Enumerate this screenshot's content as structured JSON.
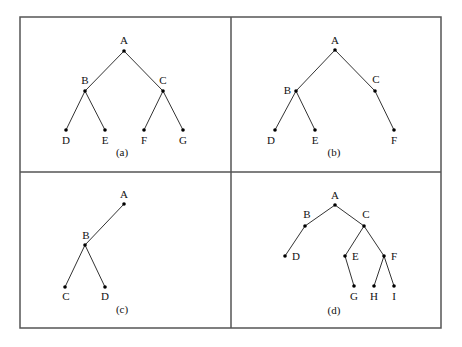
{
  "figure": {
    "frame": {
      "x1": 20,
      "y1": 17,
      "x2": 441,
      "y2": 328,
      "divider_x": 231,
      "divider_y": 172,
      "stroke": "#555555"
    },
    "panels": [
      {
        "id": "a",
        "caption": "(a)",
        "caption_pos": [
          122,
          156
        ],
        "nodes": [
          {
            "label": "A",
            "x": 124,
            "y": 51,
            "lx": 124,
            "ly": 44,
            "anchor": "middle"
          },
          {
            "label": "B",
            "x": 85,
            "y": 91,
            "lx": 85,
            "ly": 84,
            "anchor": "middle"
          },
          {
            "label": "C",
            "x": 163,
            "y": 91,
            "lx": 163,
            "ly": 84,
            "anchor": "middle"
          },
          {
            "label": "D",
            "x": 66,
            "y": 130,
            "lx": 66,
            "ly": 144,
            "anchor": "middle"
          },
          {
            "label": "E",
            "x": 105,
            "y": 130,
            "lx": 105,
            "ly": 144,
            "anchor": "middle"
          },
          {
            "label": "F",
            "x": 144,
            "y": 130,
            "lx": 144,
            "ly": 144,
            "anchor": "middle"
          },
          {
            "label": "G",
            "x": 183,
            "y": 130,
            "lx": 183,
            "ly": 144,
            "anchor": "middle"
          }
        ],
        "edges": [
          [
            "A",
            "B"
          ],
          [
            "A",
            "C"
          ],
          [
            "B",
            "D"
          ],
          [
            "B",
            "E"
          ],
          [
            "C",
            "F"
          ],
          [
            "C",
            "G"
          ]
        ]
      },
      {
        "id": "b",
        "caption": "(b)",
        "caption_pos": [
          334,
          156
        ],
        "nodes": [
          {
            "label": "A",
            "x": 335,
            "y": 50,
            "lx": 335,
            "ly": 44,
            "anchor": "middle"
          },
          {
            "label": "B",
            "x": 296,
            "y": 91,
            "lx": 291,
            "ly": 94,
            "anchor": "end"
          },
          {
            "label": "C",
            "x": 375,
            "y": 91,
            "lx": 376,
            "ly": 83,
            "anchor": "middle"
          },
          {
            "label": "D",
            "x": 275,
            "y": 130,
            "lx": 271,
            "ly": 144,
            "anchor": "middle"
          },
          {
            "label": "E",
            "x": 315,
            "y": 130,
            "lx": 315,
            "ly": 144,
            "anchor": "middle"
          },
          {
            "label": "F",
            "x": 394,
            "y": 130,
            "lx": 394,
            "ly": 144,
            "anchor": "middle"
          }
        ],
        "edges": [
          [
            "A",
            "B"
          ],
          [
            "A",
            "C"
          ],
          [
            "B",
            "D"
          ],
          [
            "B",
            "E"
          ],
          [
            "C",
            "F"
          ]
        ]
      },
      {
        "id": "c",
        "caption": "(c)",
        "caption_pos": [
          122,
          313
        ],
        "nodes": [
          {
            "label": "A",
            "x": 124,
            "y": 204,
            "lx": 124,
            "ly": 198,
            "anchor": "middle"
          },
          {
            "label": "B",
            "x": 85,
            "y": 245,
            "lx": 86,
            "ly": 239,
            "anchor": "middle"
          },
          {
            "label": "C",
            "x": 65,
            "y": 287,
            "lx": 66,
            "ly": 300,
            "anchor": "middle"
          },
          {
            "label": "D",
            "x": 105,
            "y": 287,
            "lx": 105,
            "ly": 300,
            "anchor": "middle"
          }
        ],
        "edges": [
          [
            "A",
            "B"
          ],
          [
            "B",
            "C"
          ],
          [
            "B",
            "D"
          ]
        ]
      },
      {
        "id": "d",
        "caption": "(d)",
        "caption_pos": [
          334,
          314
        ],
        "nodes": [
          {
            "label": "A",
            "x": 335,
            "y": 205,
            "lx": 335,
            "ly": 199,
            "anchor": "middle"
          },
          {
            "label": "B",
            "x": 305,
            "y": 226,
            "lx": 307,
            "ly": 218,
            "anchor": "middle"
          },
          {
            "label": "C",
            "x": 364,
            "y": 226,
            "lx": 366,
            "ly": 218,
            "anchor": "middle"
          },
          {
            "label": "D",
            "x": 285,
            "y": 256,
            "lx": 292,
            "ly": 260,
            "anchor": "start"
          },
          {
            "label": "E",
            "x": 345,
            "y": 256,
            "lx": 352,
            "ly": 260,
            "anchor": "start"
          },
          {
            "label": "F",
            "x": 384,
            "y": 256,
            "lx": 391,
            "ly": 260,
            "anchor": "start"
          },
          {
            "label": "G",
            "x": 354,
            "y": 286,
            "lx": 354,
            "ly": 300,
            "anchor": "middle"
          },
          {
            "label": "H",
            "x": 374,
            "y": 286,
            "lx": 374,
            "ly": 300,
            "anchor": "middle"
          },
          {
            "label": "I",
            "x": 394,
            "y": 286,
            "lx": 394,
            "ly": 300,
            "anchor": "middle"
          }
        ],
        "edges": [
          [
            "A",
            "B"
          ],
          [
            "A",
            "C"
          ],
          [
            "B",
            "D"
          ],
          [
            "C",
            "E"
          ],
          [
            "C",
            "F"
          ],
          [
            "E",
            "G"
          ],
          [
            "F",
            "H"
          ],
          [
            "F",
            "I"
          ]
        ]
      }
    ]
  }
}
